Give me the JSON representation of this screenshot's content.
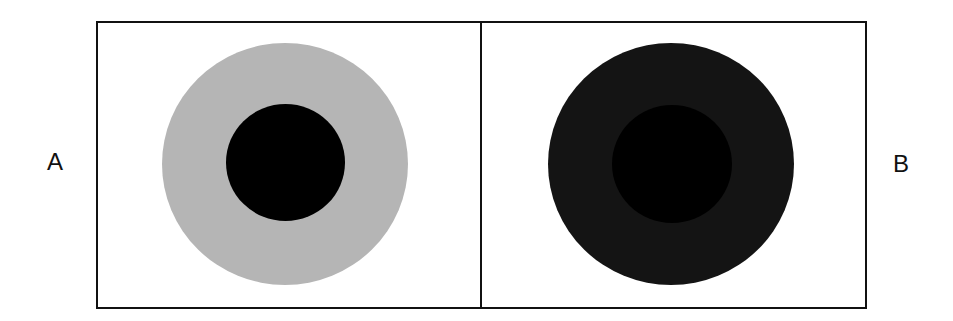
{
  "figure": {
    "labels": {
      "left": "A",
      "right": "B"
    },
    "panels": [
      {
        "id": "A",
        "outer_color": "#b5b5b5",
        "inner_color": "#000000"
      },
      {
        "id": "B",
        "outer_color": "#111111",
        "inner_color": "#000000"
      }
    ]
  }
}
